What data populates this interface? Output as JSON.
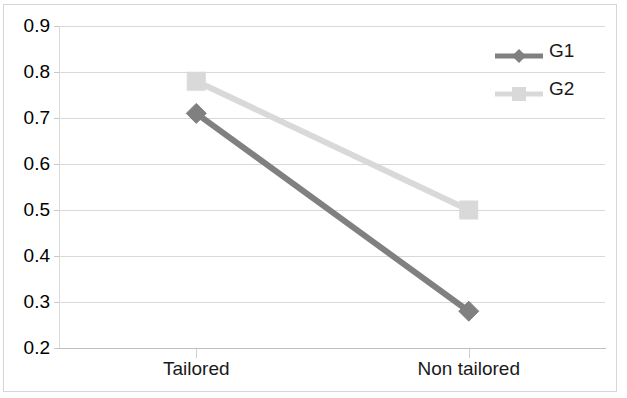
{
  "chart_data": {
    "type": "line",
    "title": "",
    "subtitle": "",
    "xlabel": "",
    "ylabel": "",
    "categories": [
      "Tailored",
      "Non tailored"
    ],
    "series": [
      {
        "name": "G1",
        "values": [
          0.71,
          0.28
        ],
        "color": "#808080",
        "marker": "diamond"
      },
      {
        "name": "G2",
        "values": [
          0.78,
          0.5
        ],
        "color": "#d9d9d9",
        "marker": "square"
      }
    ],
    "ylim": [
      0.2,
      0.9
    ],
    "yticks": [
      0.9,
      0.8,
      0.7,
      0.6,
      0.5,
      0.4,
      0.3,
      0.2
    ],
    "ytick_labels": [
      "0.9",
      "0.8",
      "0.7",
      "0.6",
      "0.5",
      "0.4",
      "0.3",
      "0.2"
    ],
    "grid": true,
    "grid_axis": "y",
    "legend_position": "top-right",
    "legend_entries": [
      "G1",
      "G2"
    ],
    "background": "#ffffff",
    "gridline_color": "#d9d9d9",
    "border_color": "#d6d6d6",
    "text_color": "#1a1a1a"
  },
  "axes": {
    "y_ticks": [
      {
        "label": "0.9",
        "value": 0.9
      },
      {
        "label": "0.8",
        "value": 0.8
      },
      {
        "label": "0.7",
        "value": 0.7
      },
      {
        "label": "0.6",
        "value": 0.6
      },
      {
        "label": "0.5",
        "value": 0.5
      },
      {
        "label": "0.4",
        "value": 0.4
      },
      {
        "label": "0.3",
        "value": 0.3
      },
      {
        "label": "0.2",
        "value": 0.2
      }
    ],
    "x_ticks": [
      {
        "label": "Tailored"
      },
      {
        "label": "Non tailored"
      }
    ]
  },
  "legend": {
    "items": [
      {
        "label": "G1",
        "color": "#808080",
        "marker": "diamond-marker-icon"
      },
      {
        "label": "G2",
        "color": "#d9d9d9",
        "marker": "square-marker-icon"
      }
    ]
  }
}
